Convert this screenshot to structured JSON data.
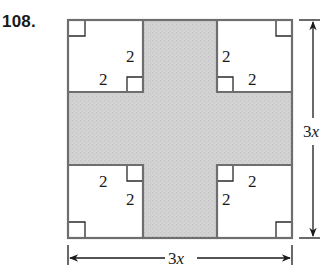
{
  "problem": {
    "number": "108."
  },
  "figure": {
    "shaded_color": "#cfcfcf",
    "outline_color": "#6e6e6e",
    "corner_squares": [
      {
        "position": "top-left",
        "labels": [
          "2",
          "2"
        ]
      },
      {
        "position": "top-right",
        "labels": [
          "2",
          "2"
        ]
      },
      {
        "position": "bottom-left",
        "labels": [
          "2",
          "2"
        ]
      },
      {
        "position": "bottom-right",
        "labels": [
          "2",
          "2"
        ]
      }
    ],
    "labels": {
      "tl_vertical": "2",
      "tl_horizontal": "2",
      "tr_vertical": "2",
      "tr_horizontal": "2",
      "bl_horizontal": "2",
      "bl_vertical": "2",
      "br_horizontal": "2",
      "br_vertical": "2"
    },
    "dimensions": {
      "height": "3x",
      "width": "3x"
    }
  }
}
